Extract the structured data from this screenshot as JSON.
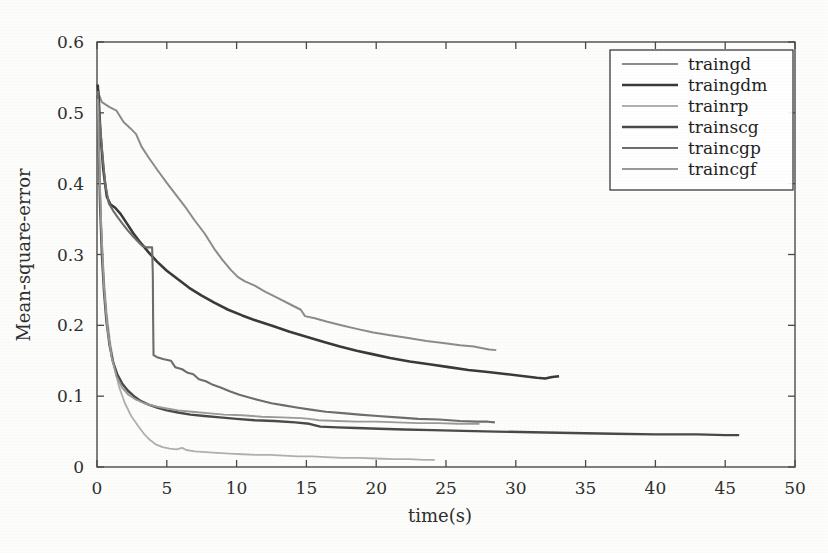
{
  "figure": {
    "background_color": "#fdfdfc",
    "frame_color": "#4a4a4a",
    "title": ""
  },
  "axes": {
    "x": {
      "label": "time(s)",
      "min": 0,
      "max": 50,
      "ticks": [
        0,
        5,
        10,
        15,
        20,
        25,
        30,
        35,
        40,
        45,
        50
      ],
      "tick_labels": [
        "0",
        "5",
        "10",
        "15",
        "20",
        "25",
        "30",
        "35",
        "40",
        "45",
        "50"
      ]
    },
    "y": {
      "label": "Mean-square-error",
      "min": 0,
      "max": 0.6,
      "ticks": [
        0,
        0.1,
        0.2,
        0.3,
        0.4,
        0.5,
        0.6
      ],
      "tick_labels": [
        "0",
        "0.1",
        "0.2",
        "0.3",
        "0.4",
        "0.5",
        "0.6"
      ]
    }
  },
  "legend": {
    "position": "top-right",
    "border_color": "#3c3c3c",
    "entries": [
      {
        "label": "traingd",
        "color": "#8c8c8c",
        "width": 2.0
      },
      {
        "label": "traingdm",
        "color": "#3a3a3a",
        "width": 2.6
      },
      {
        "label": "trainrp",
        "color": "#b0b0b0",
        "width": 1.8
      },
      {
        "label": "trainscg",
        "color": "#4a4a4a",
        "width": 2.4
      },
      {
        "label": "traincgp",
        "color": "#6e6e6e",
        "width": 2.1
      },
      {
        "label": "traincgf",
        "color": "#9a9a9a",
        "width": 1.9
      }
    ]
  },
  "chart_data": {
    "type": "line",
    "title": "",
    "xlabel": "time(s)",
    "ylabel": "Mean-square-error",
    "xlim": [
      0,
      50
    ],
    "ylim": [
      0,
      0.6
    ],
    "grid": false,
    "legend_position": "top-right",
    "series": [
      {
        "name": "traingd",
        "color": "#8c8c8c",
        "points": [
          [
            0.05,
            0.535
          ],
          [
            0.15,
            0.525
          ],
          [
            0.35,
            0.515
          ],
          [
            0.9,
            0.508
          ],
          [
            1.4,
            0.503
          ],
          [
            1.9,
            0.487
          ],
          [
            2.4,
            0.478
          ],
          [
            2.8,
            0.47
          ],
          [
            3.2,
            0.452
          ],
          [
            3.7,
            0.437
          ],
          [
            4.3,
            0.42
          ],
          [
            5.0,
            0.401
          ],
          [
            5.7,
            0.383
          ],
          [
            6.4,
            0.365
          ],
          [
            7.0,
            0.348
          ],
          [
            7.7,
            0.33
          ],
          [
            8.4,
            0.308
          ],
          [
            9.0,
            0.292
          ],
          [
            9.6,
            0.278
          ],
          [
            10.1,
            0.268
          ],
          [
            10.6,
            0.262
          ],
          [
            11.3,
            0.256
          ],
          [
            12.0,
            0.248
          ],
          [
            13.0,
            0.238
          ],
          [
            14.0,
            0.228
          ],
          [
            14.6,
            0.222
          ],
          [
            14.9,
            0.213
          ],
          [
            15.6,
            0.21
          ],
          [
            16.5,
            0.205
          ],
          [
            17.5,
            0.2
          ],
          [
            18.6,
            0.195
          ],
          [
            19.8,
            0.19
          ],
          [
            21.0,
            0.186
          ],
          [
            22.3,
            0.182
          ],
          [
            23.6,
            0.178
          ],
          [
            24.8,
            0.175
          ],
          [
            26.0,
            0.172
          ],
          [
            27.0,
            0.17
          ],
          [
            27.8,
            0.167
          ],
          [
            28.1,
            0.166
          ],
          [
            28.6,
            0.165
          ]
        ]
      },
      {
        "name": "traingdm",
        "color": "#3a3a3a",
        "points": [
          [
            0.05,
            0.54
          ],
          [
            0.12,
            0.52
          ],
          [
            0.25,
            0.47
          ],
          [
            0.45,
            0.42
          ],
          [
            0.7,
            0.382
          ],
          [
            0.95,
            0.371
          ],
          [
            1.3,
            0.366
          ],
          [
            1.7,
            0.357
          ],
          [
            2.1,
            0.345
          ],
          [
            2.6,
            0.33
          ],
          [
            3.1,
            0.317
          ],
          [
            3.7,
            0.303
          ],
          [
            4.3,
            0.29
          ],
          [
            5.0,
            0.277
          ],
          [
            5.8,
            0.265
          ],
          [
            6.6,
            0.253
          ],
          [
            7.5,
            0.242
          ],
          [
            8.4,
            0.232
          ],
          [
            9.4,
            0.222
          ],
          [
            10.4,
            0.214
          ],
          [
            11.5,
            0.206
          ],
          [
            12.6,
            0.199
          ],
          [
            13.8,
            0.191
          ],
          [
            15.0,
            0.184
          ],
          [
            16.2,
            0.177
          ],
          [
            17.4,
            0.17
          ],
          [
            18.6,
            0.164
          ],
          [
            19.8,
            0.159
          ],
          [
            21.0,
            0.154
          ],
          [
            22.4,
            0.149
          ],
          [
            23.8,
            0.145
          ],
          [
            25.2,
            0.141
          ],
          [
            26.6,
            0.137
          ],
          [
            28.0,
            0.134
          ],
          [
            29.4,
            0.131
          ],
          [
            30.6,
            0.128
          ],
          [
            31.5,
            0.126
          ],
          [
            32.1,
            0.125
          ],
          [
            32.6,
            0.127
          ],
          [
            33.1,
            0.128
          ]
        ]
      },
      {
        "name": "trainrp",
        "color": "#b0b0b0",
        "points": [
          [
            0.05,
            0.53
          ],
          [
            0.12,
            0.47
          ],
          [
            0.22,
            0.39
          ],
          [
            0.35,
            0.32
          ],
          [
            0.5,
            0.265
          ],
          [
            0.7,
            0.215
          ],
          [
            0.95,
            0.175
          ],
          [
            1.25,
            0.14
          ],
          [
            1.6,
            0.112
          ],
          [
            2.0,
            0.09
          ],
          [
            2.45,
            0.072
          ],
          [
            2.95,
            0.058
          ],
          [
            3.4,
            0.046
          ],
          [
            3.8,
            0.038
          ],
          [
            4.2,
            0.032
          ],
          [
            4.7,
            0.028
          ],
          [
            5.2,
            0.026
          ],
          [
            5.7,
            0.025
          ],
          [
            6.1,
            0.027
          ],
          [
            6.4,
            0.024
          ],
          [
            7.0,
            0.022
          ],
          [
            7.8,
            0.021
          ],
          [
            8.6,
            0.02
          ],
          [
            9.5,
            0.019
          ],
          [
            10.4,
            0.018
          ],
          [
            11.4,
            0.017
          ],
          [
            12.4,
            0.017
          ],
          [
            13.4,
            0.016
          ],
          [
            14.4,
            0.015
          ],
          [
            15.4,
            0.015
          ],
          [
            16.4,
            0.014
          ],
          [
            17.6,
            0.013
          ],
          [
            18.8,
            0.013
          ],
          [
            20.0,
            0.012
          ],
          [
            21.2,
            0.011
          ],
          [
            22.4,
            0.011
          ],
          [
            23.4,
            0.01
          ],
          [
            24.2,
            0.01
          ]
        ]
      },
      {
        "name": "trainscg",
        "color": "#4a4a4a",
        "points": [
          [
            0.05,
            0.525
          ],
          [
            0.12,
            0.455
          ],
          [
            0.22,
            0.37
          ],
          [
            0.35,
            0.3
          ],
          [
            0.5,
            0.248
          ],
          [
            0.68,
            0.205
          ],
          [
            0.9,
            0.172
          ],
          [
            1.15,
            0.148
          ],
          [
            1.45,
            0.131
          ],
          [
            1.8,
            0.118
          ],
          [
            2.2,
            0.108
          ],
          [
            2.65,
            0.1
          ],
          [
            3.15,
            0.093
          ],
          [
            3.7,
            0.088
          ],
          [
            4.3,
            0.084
          ],
          [
            5.0,
            0.08
          ],
          [
            5.8,
            0.077
          ],
          [
            6.7,
            0.074
          ],
          [
            7.7,
            0.072
          ],
          [
            8.8,
            0.07
          ],
          [
            10.0,
            0.068
          ],
          [
            11.3,
            0.066
          ],
          [
            12.7,
            0.065
          ],
          [
            14.2,
            0.063
          ],
          [
            15.2,
            0.061
          ],
          [
            16.0,
            0.057
          ],
          [
            17.2,
            0.056
          ],
          [
            18.6,
            0.055
          ],
          [
            20.2,
            0.054
          ],
          [
            22.0,
            0.053
          ],
          [
            24.0,
            0.052
          ],
          [
            26.2,
            0.051
          ],
          [
            28.6,
            0.05
          ],
          [
            31.2,
            0.049
          ],
          [
            34.0,
            0.048
          ],
          [
            37.0,
            0.047
          ],
          [
            40.0,
            0.046
          ],
          [
            43.0,
            0.046
          ],
          [
            45.0,
            0.045
          ],
          [
            46.0,
            0.045
          ]
        ]
      },
      {
        "name": "traincgp",
        "color": "#6e6e6e",
        "points": [
          [
            0.05,
            0.53
          ],
          [
            0.15,
            0.5
          ],
          [
            0.35,
            0.45
          ],
          [
            0.6,
            0.398
          ],
          [
            0.85,
            0.372
          ],
          [
            1.15,
            0.362
          ],
          [
            1.5,
            0.352
          ],
          [
            1.85,
            0.343
          ],
          [
            2.2,
            0.334
          ],
          [
            2.6,
            0.325
          ],
          [
            2.95,
            0.318
          ],
          [
            3.25,
            0.312
          ],
          [
            3.6,
            0.31
          ],
          [
            3.95,
            0.31
          ],
          [
            4.0,
            0.27
          ],
          [
            4.02,
            0.21
          ],
          [
            4.05,
            0.158
          ],
          [
            4.3,
            0.155
          ],
          [
            4.8,
            0.152
          ],
          [
            5.3,
            0.15
          ],
          [
            5.6,
            0.141
          ],
          [
            6.1,
            0.138
          ],
          [
            6.5,
            0.133
          ],
          [
            6.9,
            0.131
          ],
          [
            7.3,
            0.124
          ],
          [
            7.8,
            0.121
          ],
          [
            8.3,
            0.116
          ],
          [
            8.9,
            0.112
          ],
          [
            9.5,
            0.107
          ],
          [
            10.2,
            0.102
          ],
          [
            10.9,
            0.098
          ],
          [
            11.7,
            0.094
          ],
          [
            12.5,
            0.09
          ],
          [
            13.4,
            0.087
          ],
          [
            14.3,
            0.084
          ],
          [
            15.3,
            0.081
          ],
          [
            16.4,
            0.078
          ],
          [
            17.6,
            0.076
          ],
          [
            18.8,
            0.074
          ],
          [
            20.1,
            0.072
          ],
          [
            21.5,
            0.07
          ],
          [
            23.0,
            0.068
          ],
          [
            24.5,
            0.067
          ],
          [
            26.0,
            0.065
          ],
          [
            27.2,
            0.064
          ],
          [
            28.0,
            0.064
          ],
          [
            28.5,
            0.063
          ]
        ]
      },
      {
        "name": "traincgf",
        "color": "#9a9a9a",
        "points": [
          [
            0.05,
            0.52
          ],
          [
            0.15,
            0.44
          ],
          [
            0.3,
            0.34
          ],
          [
            0.5,
            0.255
          ],
          [
            0.75,
            0.195
          ],
          [
            1.05,
            0.155
          ],
          [
            1.4,
            0.128
          ],
          [
            1.8,
            0.112
          ],
          [
            2.25,
            0.102
          ],
          [
            2.8,
            0.095
          ],
          [
            3.4,
            0.09
          ],
          [
            4.1,
            0.086
          ],
          [
            4.9,
            0.083
          ],
          [
            5.8,
            0.08
          ],
          [
            6.8,
            0.078
          ],
          [
            7.9,
            0.076
          ],
          [
            9.1,
            0.074
          ],
          [
            10.4,
            0.073
          ],
          [
            11.8,
            0.071
          ],
          [
            13.2,
            0.07
          ],
          [
            14.6,
            0.069
          ],
          [
            15.2,
            0.068
          ],
          [
            15.9,
            0.066
          ],
          [
            17.2,
            0.065
          ],
          [
            18.6,
            0.064
          ],
          [
            20.0,
            0.064
          ],
          [
            21.5,
            0.063
          ],
          [
            23.0,
            0.062
          ],
          [
            24.5,
            0.062
          ],
          [
            25.8,
            0.061
          ],
          [
            26.8,
            0.061
          ],
          [
            27.4,
            0.061
          ]
        ]
      }
    ]
  }
}
